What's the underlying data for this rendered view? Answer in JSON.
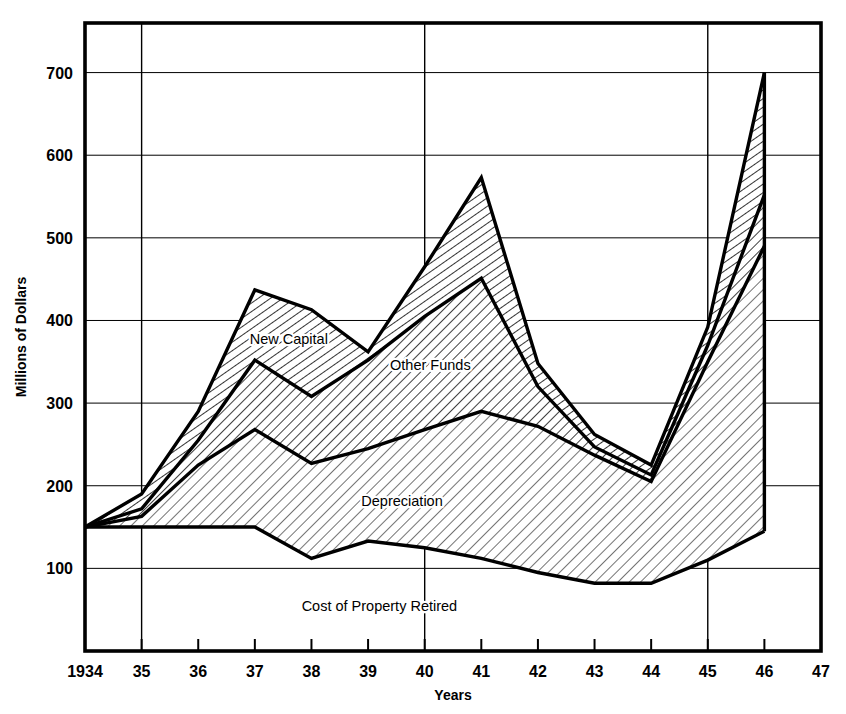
{
  "chart_data": {
    "type": "area",
    "title": "",
    "xlabel": "Years",
    "ylabel": "Millions of Dollars",
    "xlim": [
      1934,
      1947
    ],
    "ylim": [
      0,
      760
    ],
    "yticks": [
      100,
      200,
      300,
      400,
      500,
      600,
      700
    ],
    "ytick_labels": [
      "100",
      "200",
      "300",
      "400",
      "500",
      "600",
      "700"
    ],
    "xticks": [
      1934,
      1935,
      1936,
      1937,
      1938,
      1939,
      1940,
      1941,
      1942,
      1943,
      1944,
      1945,
      1946,
      1947
    ],
    "xtick_labels": [
      "1934",
      "35",
      "36",
      "37",
      "38",
      "39",
      "40",
      "41",
      "42",
      "43",
      "44",
      "45",
      "46",
      "47"
    ],
    "major_gridlines_x": [
      1935,
      1940,
      1945
    ],
    "grid": true,
    "legend_position": "inline-annotation",
    "x": [
      1934,
      1935,
      1936,
      1937,
      1938,
      1939,
      1940,
      1941,
      1942,
      1943,
      1944,
      1945,
      1946
    ],
    "series": [
      {
        "name": "Cost of Property Retired",
        "role": "baseline-lower-boundary",
        "label": "Cost of Property Retired",
        "values": [
          150,
          150,
          150,
          150,
          112,
          133,
          125,
          112,
          95,
          82,
          82,
          110,
          145
        ]
      },
      {
        "name": "Depreciation",
        "role": "cumulative-upper-boundary-band-1",
        "label": "Depreciation",
        "values": [
          150,
          163,
          225,
          268,
          227,
          245,
          268,
          290,
          272,
          237,
          205,
          350,
          490
        ]
      },
      {
        "name": "Other Funds",
        "role": "cumulative-upper-boundary-band-2",
        "label": "Other Funds",
        "values": [
          150,
          172,
          255,
          352,
          308,
          352,
          405,
          451,
          320,
          247,
          213,
          370,
          552
        ]
      },
      {
        "name": "New Capital",
        "role": "cumulative-upper-boundary-band-3",
        "label": "New Capital",
        "values": [
          150,
          190,
          290,
          437,
          413,
          362,
          465,
          573,
          348,
          262,
          225,
          392,
          700
        ]
      }
    ],
    "annotations": [
      {
        "text": "New Capital",
        "x": 1937.6,
        "y": 372
      },
      {
        "text": "Other Funds",
        "x": 1940.1,
        "y": 340
      },
      {
        "text": "Depreciation",
        "x": 1939.6,
        "y": 175
      },
      {
        "text": "Cost of Property Retired",
        "x": 1939.2,
        "y": 48
      }
    ]
  }
}
